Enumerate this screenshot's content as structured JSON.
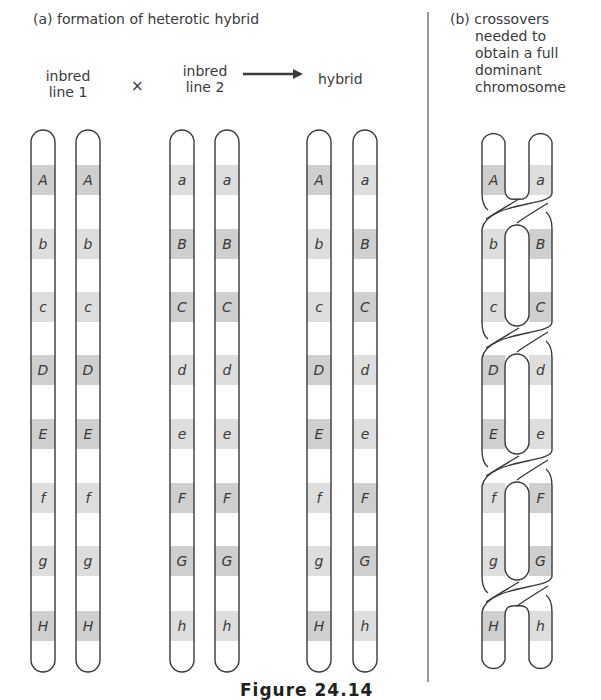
{
  "panel_a": {
    "title": "(a) formation of heterotic hybrid",
    "groups": [
      {
        "label_line1": "inbred",
        "label_line2": "line 1",
        "chromosomes": [
          [
            "A",
            "b",
            "c",
            "D",
            "E",
            "f",
            "g",
            "H"
          ],
          [
            "A",
            "b",
            "c",
            "D",
            "E",
            "f",
            "g",
            "H"
          ]
        ]
      },
      {
        "label_line1": "inbred",
        "label_line2": "line 2",
        "chromosomes": [
          [
            "a",
            "B",
            "C",
            "d",
            "e",
            "F",
            "G",
            "h"
          ],
          [
            "a",
            "B",
            "C",
            "d",
            "e",
            "F",
            "G",
            "h"
          ]
        ]
      },
      {
        "label_line1": "hybrid",
        "label_line2": "",
        "chromosomes": [
          [
            "A",
            "b",
            "c",
            "D",
            "E",
            "f",
            "g",
            "H"
          ],
          [
            "a",
            "B",
            "C",
            "d",
            "e",
            "F",
            "G",
            "h"
          ]
        ]
      }
    ],
    "cross_symbol": "×",
    "arrow": "right-arrow"
  },
  "panel_b": {
    "title_lines": [
      "(b) crossovers",
      "needed to",
      "obtain a full",
      "dominant",
      "chromosome"
    ],
    "left_bands": [
      "A",
      "b",
      "c",
      "D",
      "E",
      "f",
      "g",
      "H"
    ],
    "right_bands": [
      "a",
      "B",
      "C",
      "d",
      "e",
      "F",
      "G",
      "h"
    ],
    "crossover_count": 4
  },
  "caption": "Figure 24.14",
  "colors": {
    "outline": "#3a3a3a",
    "dominant_band": "#cfcfcf",
    "recessive_band": "#dedede",
    "background": "#ffffff"
  }
}
